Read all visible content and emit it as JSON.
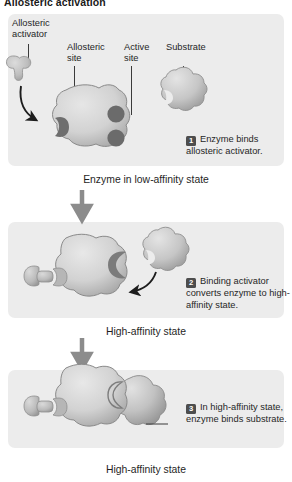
{
  "figure": {
    "title": "Allosteric activation",
    "type": "biology-process-diagram",
    "palette": {
      "band_background": "#ececec",
      "enzyme_fill": "#d4d4d4",
      "enzyme_shadow": "#9a9a9a",
      "site_dark": "#6e6e6e",
      "activator_fill": "#c2c2c2",
      "substrate_fill": "#c9c9c9",
      "arrow_gray": "#8c8c8c",
      "leader_line": "#3a3a3a",
      "badge_background": "#4d4d4d",
      "badge_text": "#ffffff",
      "text": "#262626"
    }
  },
  "callouts": {
    "allosteric_activator": "Allosteric\nactivator",
    "allosteric_site": "Allosteric\nsite",
    "active_site": "Active\nsite",
    "substrate": "Substrate"
  },
  "panels": [
    {
      "id": "panel-1",
      "state_label": "Enzyme in low-affinity state",
      "step_number": "1",
      "step_text": "Enzyme binds allosteric activator.",
      "shapes": [
        "allosteric-activator",
        "enzyme-low-affinity",
        "substrate-free"
      ]
    },
    {
      "id": "panel-2",
      "state_label": "High-affinity state",
      "step_number": "2",
      "step_text": "Binding activator converts enzyme to high-affinity state.",
      "shapes": [
        "allosteric-activator-bound",
        "enzyme-high-affinity",
        "substrate-free"
      ]
    },
    {
      "id": "panel-3",
      "state_label": "High-affinity state",
      "step_number": "3",
      "step_text": "In high-affinity state, enzyme binds substrate.",
      "shapes": [
        "allosteric-activator-bound",
        "enzyme-high-affinity",
        "substrate-bound"
      ]
    }
  ]
}
